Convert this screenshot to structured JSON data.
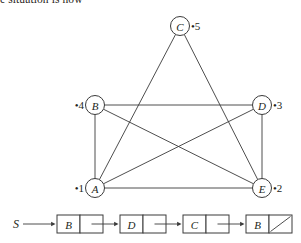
{
  "caption": {
    "text": "e situation is now"
  },
  "graph": {
    "stroke_color": "#3a3a3a",
    "node_fill": "#ffffff",
    "nodes": [
      {
        "id": "A",
        "label": "A",
        "tag": "•1",
        "tag_side": "left",
        "cx": 95,
        "cy": 188,
        "r": 9.5
      },
      {
        "id": "B",
        "label": "B",
        "tag": "•4",
        "tag_side": "left",
        "cx": 95,
        "cy": 105,
        "r": 9.5
      },
      {
        "id": "C",
        "label": "C",
        "tag": "•5",
        "tag_side": "right",
        "cx": 180,
        "cy": 26,
        "r": 9.5
      },
      {
        "id": "D",
        "label": "D",
        "tag": "•3",
        "tag_side": "right",
        "cx": 262,
        "cy": 105,
        "r": 9.5
      },
      {
        "id": "E",
        "label": "E",
        "tag": "•2",
        "tag_side": "right",
        "cx": 262,
        "cy": 188,
        "r": 9.5
      }
    ],
    "edges": [
      {
        "from": "A",
        "to": "B"
      },
      {
        "from": "A",
        "to": "C"
      },
      {
        "from": "A",
        "to": "D"
      },
      {
        "from": "A",
        "to": "E"
      },
      {
        "from": "B",
        "to": "D"
      },
      {
        "from": "B",
        "to": "E"
      },
      {
        "from": "C",
        "to": "E"
      },
      {
        "from": "D",
        "to": "E"
      }
    ]
  },
  "linked_list": {
    "stroke_color": "#3a3a3a",
    "start_label": "S",
    "nodes": [
      {
        "label": "B",
        "next": "pointer"
      },
      {
        "label": "D",
        "next": "pointer"
      },
      {
        "label": "C",
        "next": "pointer"
      },
      {
        "label": "B",
        "next": "null"
      }
    ]
  }
}
